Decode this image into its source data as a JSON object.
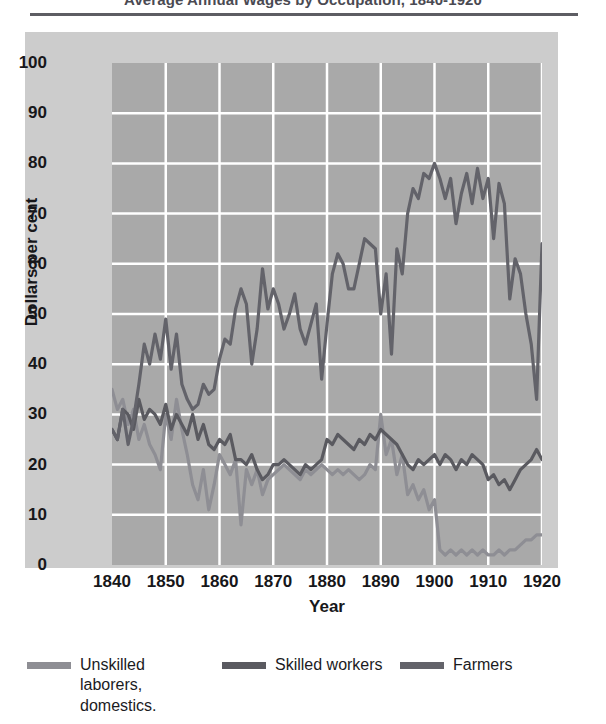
{
  "chart_data": {
    "type": "line",
    "title": "Average Annual Wages by Occupation, 1840-1920",
    "xlabel": "Year",
    "ylabel": "Dollars per cent",
    "xlim": [
      1840,
      1920
    ],
    "ylim": [
      0,
      100
    ],
    "xticks": [
      1840,
      1850,
      1860,
      1870,
      1880,
      1890,
      1900,
      1910,
      1920
    ],
    "yticks": [
      0,
      10,
      20,
      30,
      40,
      50,
      60,
      70,
      80,
      90,
      100
    ],
    "grid": true,
    "grid_color": "#ffffff",
    "plot_background": "#a9a9a9",
    "panel_background": "#cccccc",
    "legend_position": "bottom",
    "series": [
      {
        "name": "Unskilled laborers, domestics.",
        "legend_label": "Unskilled\nlaborers,\ndomestics.",
        "color": "#8e8e94",
        "x": [
          1840,
          1841,
          1842,
          1843,
          1844,
          1845,
          1846,
          1847,
          1848,
          1849,
          1850,
          1851,
          1852,
          1853,
          1854,
          1855,
          1856,
          1857,
          1858,
          1859,
          1860,
          1861,
          1862,
          1863,
          1864,
          1865,
          1866,
          1867,
          1868,
          1869,
          1870,
          1871,
          1872,
          1873,
          1874,
          1875,
          1876,
          1877,
          1878,
          1879,
          1880,
          1881,
          1882,
          1883,
          1884,
          1885,
          1886,
          1887,
          1888,
          1889,
          1890,
          1891,
          1892,
          1893,
          1894,
          1895,
          1896,
          1897,
          1898,
          1899,
          1900,
          1901,
          1902,
          1903,
          1904,
          1905,
          1906,
          1907,
          1908,
          1909,
          1910,
          1911,
          1912,
          1913,
          1914,
          1915,
          1916,
          1917,
          1918,
          1919,
          1920
        ],
        "values": [
          35,
          31,
          33,
          28,
          31,
          25,
          28,
          24,
          22,
          19,
          30,
          25,
          33,
          27,
          22,
          16,
          13,
          19,
          11,
          16,
          22,
          20,
          18,
          21,
          8,
          19,
          16,
          19,
          14,
          17,
          18,
          19,
          20,
          19,
          18,
          17,
          19,
          18,
          19,
          20,
          19,
          18,
          19,
          18,
          19,
          18,
          17,
          18,
          20,
          19,
          30,
          22,
          25,
          18,
          22,
          14,
          16,
          13,
          15,
          11,
          13,
          3,
          2,
          3,
          2,
          3,
          2,
          3,
          2,
          3,
          2,
          2,
          3,
          2,
          3,
          3,
          4,
          5,
          5,
          6,
          6
        ]
      },
      {
        "name": "Skilled workers",
        "legend_label": "Skilled workers",
        "color": "#5a5a60",
        "x": [
          1840,
          1841,
          1842,
          1843,
          1844,
          1845,
          1846,
          1847,
          1848,
          1849,
          1850,
          1851,
          1852,
          1853,
          1854,
          1855,
          1856,
          1857,
          1858,
          1859,
          1860,
          1861,
          1862,
          1863,
          1864,
          1865,
          1866,
          1867,
          1868,
          1869,
          1870,
          1871,
          1872,
          1873,
          1874,
          1875,
          1876,
          1877,
          1878,
          1879,
          1880,
          1881,
          1882,
          1883,
          1884,
          1885,
          1886,
          1887,
          1888,
          1889,
          1890,
          1891,
          1892,
          1893,
          1894,
          1895,
          1896,
          1897,
          1898,
          1899,
          1900,
          1901,
          1902,
          1903,
          1904,
          1905,
          1906,
          1907,
          1908,
          1909,
          1910,
          1911,
          1912,
          1913,
          1914,
          1915,
          1916,
          1917,
          1918,
          1919,
          1920
        ],
        "values": [
          27,
          25,
          31,
          30,
          27,
          33,
          29,
          31,
          30,
          28,
          32,
          27,
          30,
          28,
          26,
          30,
          25,
          28,
          24,
          23,
          25,
          24,
          26,
          21,
          21,
          20,
          22,
          19,
          17,
          18,
          20,
          20,
          21,
          20,
          19,
          18,
          20,
          19,
          20,
          21,
          25,
          24,
          26,
          25,
          24,
          23,
          25,
          24,
          26,
          25,
          27,
          26,
          25,
          24,
          22,
          20,
          19,
          21,
          20,
          21,
          22,
          20,
          22,
          21,
          19,
          21,
          20,
          22,
          21,
          20,
          17,
          18,
          16,
          17,
          15,
          17,
          19,
          20,
          21,
          23,
          21
        ]
      },
      {
        "name": "Farmers",
        "legend_label": "Farmers",
        "color": "#63636a",
        "x": [
          1840,
          1841,
          1842,
          1843,
          1844,
          1845,
          1846,
          1847,
          1848,
          1849,
          1850,
          1851,
          1852,
          1853,
          1854,
          1855,
          1856,
          1857,
          1858,
          1859,
          1860,
          1861,
          1862,
          1863,
          1864,
          1865,
          1866,
          1867,
          1868,
          1869,
          1870,
          1871,
          1872,
          1873,
          1874,
          1875,
          1876,
          1877,
          1878,
          1879,
          1880,
          1881,
          1882,
          1883,
          1884,
          1885,
          1886,
          1887,
          1888,
          1889,
          1890,
          1891,
          1892,
          1893,
          1894,
          1895,
          1896,
          1897,
          1898,
          1899,
          1900,
          1901,
          1902,
          1903,
          1904,
          1905,
          1906,
          1907,
          1908,
          1909,
          1910,
          1911,
          1912,
          1913,
          1914,
          1915,
          1916,
          1917,
          1918,
          1919,
          1920
        ],
        "values": [
          27,
          25,
          31,
          24,
          29,
          36,
          44,
          40,
          46,
          41,
          49,
          39,
          46,
          36,
          33,
          31,
          32,
          36,
          34,
          35,
          41,
          45,
          44,
          51,
          55,
          52,
          40,
          47,
          59,
          51,
          55,
          52,
          47,
          50,
          54,
          47,
          44,
          48,
          52,
          37,
          48,
          58,
          62,
          60,
          55,
          55,
          60,
          65,
          64,
          63,
          50,
          58,
          42,
          63,
          58,
          70,
          75,
          73,
          78,
          77,
          80,
          77,
          73,
          77,
          68,
          74,
          78,
          72,
          79,
          73,
          77,
          65,
          76,
          72,
          53,
          61,
          58,
          50,
          44,
          33,
          64
        ]
      }
    ]
  },
  "legend": {
    "items": [
      {
        "label": "Unskilled\nlaborers,\ndomestics.",
        "color": "#8e8e94"
      },
      {
        "label": "Skilled workers",
        "color": "#5a5a60"
      },
      {
        "label": "Farmers",
        "color": "#63636a"
      }
    ]
  }
}
